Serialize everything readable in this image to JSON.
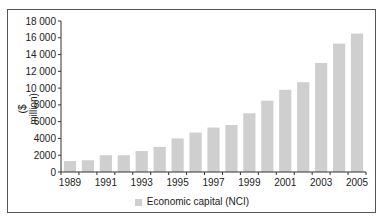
{
  "chart_data": {
    "type": "bar",
    "title": "",
    "xlabel": "",
    "ylabel": "($ million)",
    "ylim": [
      0,
      18000
    ],
    "yticks": [
      0,
      2000,
      4000,
      6000,
      8000,
      10000,
      12000,
      14000,
      16000,
      18000
    ],
    "ytick_labels": [
      "0",
      "2000",
      "4000",
      "6000",
      "8000",
      "10 000",
      "12 000",
      "14 000",
      "16 000",
      "18 000"
    ],
    "categories": [
      "1989",
      "1990",
      "1991",
      "1992",
      "1993",
      "1994",
      "1995",
      "1996",
      "1997",
      "1998",
      "1999",
      "2000",
      "2001",
      "2002",
      "2003",
      "2004",
      "2005"
    ],
    "xtick_labels": [
      "1989",
      "1991",
      "1993",
      "1995",
      "1997",
      "1999",
      "2001",
      "2003",
      "2005"
    ],
    "series": [
      {
        "name": "Economic capital (NCI)",
        "color": "#cfcfcf",
        "values": [
          1300,
          1400,
          2000,
          2000,
          2500,
          3000,
          4000,
          4700,
          5300,
          5600,
          7000,
          8500,
          9800,
          10700,
          13000,
          15300,
          16500
        ]
      }
    ],
    "legend_position": "bottom",
    "grid": false
  },
  "legend": {
    "label": "Economic capital (NCI)"
  },
  "axis": {
    "ylabel": "($ million)"
  }
}
